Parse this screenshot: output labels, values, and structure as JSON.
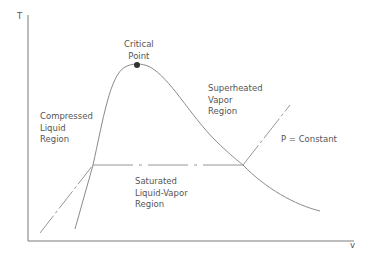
{
  "diagram": {
    "axes": {
      "y_label": "T",
      "x_label": "v"
    },
    "labels": {
      "critical_point": [
        "Critical",
        "Point"
      ],
      "superheated": [
        "Superheated",
        "Vapor",
        "Region"
      ],
      "compressed": [
        "Compressed",
        "Liquid",
        "Region"
      ],
      "saturated": [
        "Saturated",
        "Liquid-Vapor",
        "Region"
      ],
      "pressure": "P = Constant"
    },
    "colors": {
      "line": "#8a8a8a",
      "axis": "#7a7a7a",
      "point": "#333333",
      "text": "#555555"
    }
  }
}
